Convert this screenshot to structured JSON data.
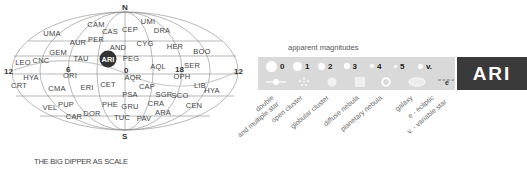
{
  "map": {
    "poles": {
      "north": "N",
      "south": "S"
    },
    "ra_labels": [
      "12",
      "6",
      "0",
      "18",
      "12"
    ],
    "highlight": {
      "label": "ARI",
      "color": "#333333"
    },
    "constellations": [
      {
        "label": "CAM",
        "x": 96,
        "y": 27
      },
      {
        "label": "CAS",
        "x": 110,
        "y": 34
      },
      {
        "label": "CEP",
        "x": 130,
        "y": 32
      },
      {
        "label": "UMI",
        "x": 148,
        "y": 24
      },
      {
        "label": "DRA",
        "x": 162,
        "y": 33
      },
      {
        "label": "UMA",
        "x": 52,
        "y": 36
      },
      {
        "label": "AUR",
        "x": 78,
        "y": 45
      },
      {
        "label": "PER",
        "x": 96,
        "y": 42
      },
      {
        "label": "AND",
        "x": 118,
        "y": 50
      },
      {
        "label": "CYG",
        "x": 145,
        "y": 46
      },
      {
        "label": "HER",
        "x": 175,
        "y": 49
      },
      {
        "label": "BOO",
        "x": 202,
        "y": 54
      },
      {
        "label": "GEM",
        "x": 58,
        "y": 55
      },
      {
        "label": "TAU",
        "x": 81,
        "y": 61
      },
      {
        "label": "PEG",
        "x": 131,
        "y": 61
      },
      {
        "label": "LEO",
        "x": 23,
        "y": 65
      },
      {
        "label": "CNC",
        "x": 41,
        "y": 63
      },
      {
        "label": "AQL",
        "x": 158,
        "y": 69
      },
      {
        "label": "SER",
        "x": 192,
        "y": 68
      },
      {
        "label": "ORI",
        "x": 70,
        "y": 78
      },
      {
        "label": "HYA",
        "x": 31,
        "y": 80
      },
      {
        "label": "AQR",
        "x": 133,
        "y": 80
      },
      {
        "label": "OPH",
        "x": 182,
        "y": 79
      },
      {
        "label": "CRT",
        "x": 19,
        "y": 88
      },
      {
        "label": "CMA",
        "x": 57,
        "y": 91
      },
      {
        "label": "ERI",
        "x": 87,
        "y": 90
      },
      {
        "label": "CET",
        "x": 108,
        "y": 87
      },
      {
        "label": "CAP",
        "x": 147,
        "y": 89
      },
      {
        "label": "LIB",
        "x": 200,
        "y": 88
      },
      {
        "label": "HYA",
        "x": 212,
        "y": 93
      },
      {
        "label": "PSA",
        "x": 130,
        "y": 97
      },
      {
        "label": "SGR",
        "x": 164,
        "y": 97
      },
      {
        "label": "SCO",
        "x": 180,
        "y": 98
      },
      {
        "label": "VEL",
        "x": 50,
        "y": 110
      },
      {
        "label": "PUP",
        "x": 66,
        "y": 107
      },
      {
        "label": "PHE",
        "x": 110,
        "y": 107
      },
      {
        "label": "GRU",
        "x": 130,
        "y": 109
      },
      {
        "label": "CRA",
        "x": 156,
        "y": 106
      },
      {
        "label": "CEN",
        "x": 194,
        "y": 108
      },
      {
        "label": "CAR",
        "x": 74,
        "y": 119
      },
      {
        "label": "DOR",
        "x": 92,
        "y": 116
      },
      {
        "label": "ARA",
        "x": 163,
        "y": 115
      },
      {
        "label": "TUC",
        "x": 122,
        "y": 120
      },
      {
        "label": "PAV",
        "x": 144,
        "y": 121
      }
    ]
  },
  "scale_caption": "THE BIG DIPPER AS SCALE",
  "legend": {
    "title": "apparent magnitudes",
    "magnitudes": [
      {
        "label": "0",
        "size": 11
      },
      {
        "label": "1",
        "size": 9
      },
      {
        "label": "2",
        "size": 7
      },
      {
        "label": "3",
        "size": 5.5
      },
      {
        "label": "4",
        "size": 4
      },
      {
        "label": "5",
        "size": 3
      },
      {
        "label": "v.",
        "size": 5
      }
    ],
    "object_types": [
      "double and multiple star",
      "open cluster",
      "globular cluster",
      "diffuse nebula",
      "planetary nebula",
      "galaxy",
      "e - ecliptic",
      "v. - variable star"
    ],
    "type_labels": {
      "double_1": "double",
      "double_2": "and multiple star",
      "open": "open cluster",
      "globular": "globular cluster",
      "diffuse": "diffuse nebula",
      "planetary": "planetary nebula",
      "galaxy": "galaxy",
      "ecliptic": "e - ecliptic",
      "variable": "v. - variable star"
    },
    "ecliptic_marker": "e",
    "panel_color": "#d9d9d9"
  },
  "badge": {
    "label": "ARI",
    "color": "#3a3a3a"
  }
}
